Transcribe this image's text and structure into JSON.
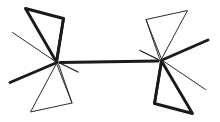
{
  "figure": {
    "kind": "chemical-structure-diagram",
    "canvas": {
      "width": 220,
      "height": 122,
      "background_color": "#ffffff"
    },
    "ink_colors": {
      "bold_stroke": "#1a1a1a",
      "thin_stroke": "#2b2b2b"
    },
    "stroke_widths": {
      "bold": 2.9,
      "medium": 2.2,
      "thin": 1.0
    },
    "atoms": [
      {
        "id": "C-left",
        "label": "",
        "x": 57.5,
        "y": 62.0,
        "role": "central-carbon-left"
      },
      {
        "id": "C-right",
        "label": "",
        "x": 160.5,
        "y": 61.0,
        "role": "central-carbon-right"
      }
    ],
    "central_bond": {
      "id": "bond-central",
      "from": "C-left",
      "to": "C-right",
      "style": "bold-line",
      "x1": 60.0,
      "y1": 62.5,
      "x2": 158.0,
      "y2": 61.0
    },
    "strokes": [
      {
        "id": "left-upper-wedge-outline",
        "group": "left-substituent-upper",
        "style": "bold",
        "width": 2.9,
        "points": "25.5,8.5 63.5,18.5 56.5,62.0 25.5,8.5"
      },
      {
        "id": "left-upper-wedge-inner",
        "group": "left-substituent-upper",
        "style": "bold",
        "width": 2.6,
        "points": "63.5,18.5 56.5,62.0"
      },
      {
        "id": "left-thin-diagonal-upper",
        "group": "left-substituent-west",
        "style": "thin",
        "width": 1.0,
        "points": "12.5,32.5 55.5,61.5"
      },
      {
        "id": "left-bold-diagonal-lower",
        "group": "left-substituent-southwest",
        "style": "bold",
        "width": 2.9,
        "points": "57.0,62.5 10.0,82.5"
      },
      {
        "id": "left-lower-triangle",
        "group": "left-substituent-lower",
        "style": "thin",
        "width": 1.0,
        "points": "56.5,63.5 30.5,112.0 72.0,103.0 56.5,63.5"
      },
      {
        "id": "left-lower-triangle-link",
        "group": "left-substituent-lower",
        "style": "thin",
        "width": 1.0,
        "points": "72.0,103.0 58.5,64.0"
      },
      {
        "id": "left-junction-thin-east",
        "group": "left-substituent-lower",
        "style": "thin",
        "width": 1.0,
        "points": "55.0,60.5 78.0,72.0"
      },
      {
        "id": "left-junction-thin-east2",
        "group": "left-substituent-lower",
        "style": "thin",
        "width": 1.0,
        "points": "78.0,72.0 59.5,63.0"
      },
      {
        "id": "right-lower-wedge-outline",
        "group": "right-substituent-lower",
        "style": "bold",
        "width": 2.9,
        "points": "192.5,113.5 154.5,103.5 161.5,61.0 192.5,113.5"
      },
      {
        "id": "right-lower-wedge-inner",
        "group": "right-substituent-lower",
        "style": "bold",
        "width": 2.6,
        "points": "154.5,103.5 161.5,61.0"
      },
      {
        "id": "right-thin-diagonal-lower",
        "group": "right-substituent-east",
        "style": "thin",
        "width": 1.0,
        "points": "205.5,89.5 162.5,60.5"
      },
      {
        "id": "right-bold-diagonal-upper",
        "group": "right-substituent-northeast",
        "style": "bold",
        "width": 2.9,
        "points": "161.0,60.5 208.0,40.0"
      },
      {
        "id": "right-upper-triangle",
        "group": "right-substituent-upper",
        "style": "thin",
        "width": 1.0,
        "points": "161.5,59.0 187.5,10.5 146.0,19.5 161.5,59.0"
      },
      {
        "id": "right-upper-triangle-link",
        "group": "right-substituent-upper",
        "style": "thin",
        "width": 1.0,
        "points": "146.0,19.5 159.5,58.5"
      },
      {
        "id": "right-junction-thin-west",
        "group": "right-substituent-upper",
        "style": "thin",
        "width": 1.0,
        "points": "163.0,62.0 140.0,50.5"
      },
      {
        "id": "right-junction-thin-west2",
        "group": "right-substituent-upper",
        "style": "thin",
        "width": 1.0,
        "points": "140.0,50.5 158.5,59.5"
      }
    ],
    "symmetry": {
      "type": "two-fold-rotation",
      "center_x": 109.0,
      "center_y": 61.0
    }
  }
}
